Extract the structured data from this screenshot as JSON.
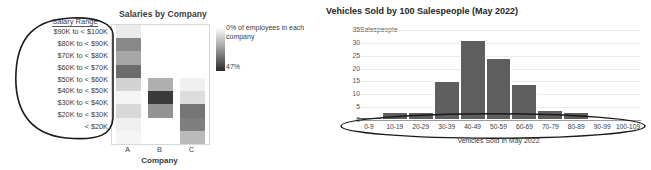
{
  "chart_data": [
    {
      "type": "heatmap",
      "title": "Salaries by Company",
      "xlabel": "Company",
      "ylabel": "Salary Range",
      "row_header": "Salary Range",
      "categories": [
        "A",
        "B",
        "C"
      ],
      "rows": [
        "$90K to < $100K",
        "$80K to < $90K",
        "$70K to < $80K",
        "$60K to < $70K",
        "$50K to < $60K",
        "$40K to < $50K",
        "$30K to < $40K",
        "$20K to < $30K",
        "< $20K"
      ],
      "values": [
        [
          4,
          0,
          0
        ],
        [
          24,
          0,
          0
        ],
        [
          18,
          0,
          0
        ],
        [
          30,
          0,
          0
        ],
        [
          9,
          16,
          3
        ],
        [
          2,
          40,
          7
        ],
        [
          8,
          22,
          28
        ],
        [
          3,
          0,
          26
        ],
        [
          2,
          0,
          14
        ]
      ],
      "colorbar": {
        "min_label": "0% of employees in each company",
        "max_label": "47%",
        "min": 0,
        "max": 47,
        "low_color": "#ffffff",
        "high_color": "#2b2b2b"
      },
      "annotation": "hand-drawn-ellipse-around-salary-range-labels"
    },
    {
      "type": "bar",
      "title": "Vehicles Sold by 100 Salespeople (May 2022)",
      "xlabel": "Vehicles Sold in May 2022",
      "ylabel": "Salespeople",
      "categories": [
        "0-9",
        "10-19",
        "20-29",
        "30-39",
        "40-49",
        "50-59",
        "60-69",
        "70-79",
        "80-89",
        "90-99",
        "100-109"
      ],
      "values": [
        1,
        3,
        3,
        15,
        31,
        24,
        14,
        4,
        3,
        0,
        0
      ],
      "yticks": [
        0,
        5,
        10,
        15,
        20,
        25,
        30,
        35
      ],
      "ylim": [
        0,
        35
      ],
      "grid": true,
      "bar_color": "#5e5e5e",
      "annotation": "hand-drawn-ellipse-around-x-axis-tick-labels"
    }
  ]
}
